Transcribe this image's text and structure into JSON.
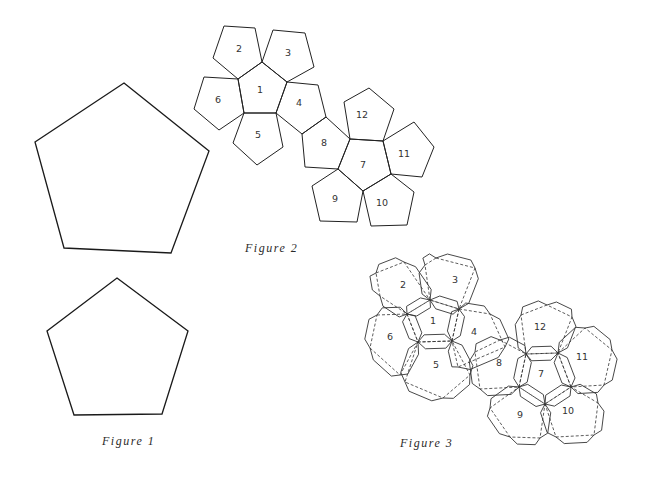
{
  "figures": {
    "figure1": {
      "caption": "Figure 1",
      "description": "Two regular pentagons (large and small) as templates",
      "large_pentagon": [
        [
          124,
          83
        ],
        [
          209,
          151
        ],
        [
          171,
          253
        ],
        [
          64,
          248
        ],
        [
          35,
          142
        ]
      ],
      "small_pentagon": [
        [
          117,
          278
        ],
        [
          188,
          331
        ],
        [
          162,
          414
        ],
        [
          74,
          415
        ],
        [
          47,
          331
        ]
      ]
    },
    "figure2": {
      "caption": "Figure 2",
      "description": "Dodecahedron net of 12 numbered pentagons",
      "faces": [
        {
          "label": "1",
          "pts": [
            [
              262,
              62
            ],
            [
              287,
              82
            ],
            [
              276,
              113
            ],
            [
              244,
              113
            ],
            [
              238,
              79
            ]
          ],
          "lx": 260,
          "ly": 93
        },
        {
          "label": "2",
          "pts": [
            [
              224,
              26
            ],
            [
              255,
              28
            ],
            [
              262,
              62
            ],
            [
              238,
              79
            ],
            [
              213,
              58
            ]
          ],
          "lx": 239,
          "ly": 52
        },
        {
          "label": "3",
          "pts": [
            [
              273,
              30
            ],
            [
              305,
              33
            ],
            [
              314,
              67
            ],
            [
              287,
              82
            ],
            [
              262,
              62
            ]
          ],
          "lx": 288,
          "ly": 56
        },
        {
          "label": "4",
          "pts": [
            [
              287,
              82
            ],
            [
              318,
              85
            ],
            [
              326,
              117
            ],
            [
              302,
              134
            ],
            [
              276,
              113
            ]
          ],
          "lx": 299,
          "ly": 106
        },
        {
          "label": "5",
          "pts": [
            [
              244,
              113
            ],
            [
              276,
              113
            ],
            [
              283,
              147
            ],
            [
              257,
              165
            ],
            [
              233,
              143
            ]
          ],
          "lx": 258,
          "ly": 138
        },
        {
          "label": "6",
          "pts": [
            [
              204,
              77
            ],
            [
              238,
              79
            ],
            [
              244,
              113
            ],
            [
              219,
              130
            ],
            [
              194,
              109
            ]
          ],
          "lx": 218,
          "ly": 103
        },
        {
          "label": "7",
          "pts": [
            [
              350,
              139
            ],
            [
              383,
              141
            ],
            [
              391,
              174
            ],
            [
              363,
              191
            ],
            [
              338,
              169
            ]
          ],
          "lx": 363,
          "ly": 168
        },
        {
          "label": "8",
          "pts": [
            [
              302,
              134
            ],
            [
              326,
              117
            ],
            [
              350,
              139
            ],
            [
              338,
              169
            ],
            [
              305,
              167
            ]
          ],
          "lx": 324,
          "ly": 146
        },
        {
          "label": "9",
          "pts": [
            [
              338,
              169
            ],
            [
              363,
              191
            ],
            [
              357,
              222
            ],
            [
              320,
              221
            ],
            [
              312,
              186
            ]
          ],
          "lx": 335,
          "ly": 202
        },
        {
          "label": "10",
          "pts": [
            [
              363,
              191
            ],
            [
              391,
              174
            ],
            [
              414,
              192
            ],
            [
              407,
              225
            ],
            [
              371,
              226
            ]
          ],
          "lx": 382,
          "ly": 206
        },
        {
          "label": "11",
          "pts": [
            [
              383,
              141
            ],
            [
              414,
              122
            ],
            [
              434,
              147
            ],
            [
              422,
              177
            ],
            [
              391,
              174
            ]
          ],
          "lx": 404,
          "ly": 157
        },
        {
          "label": "12",
          "pts": [
            [
              344,
              102
            ],
            [
              369,
              88
            ],
            [
              394,
              109
            ],
            [
              383,
              141
            ],
            [
              350,
              139
            ]
          ],
          "lx": 362,
          "ly": 118
        }
      ]
    },
    "figure3": {
      "caption": "Figure 3",
      "description": "Dodecahedron net with folding tabs and dashed fold lines",
      "faces": [
        {
          "label": "1",
          "pts": [
            [
              430,
              300
            ],
            [
              459,
              309
            ],
            [
              452,
              341
            ],
            [
              418,
              342
            ],
            [
              407,
              314
            ]
          ],
          "lx": 433,
          "ly": 324
        },
        {
          "label": "2",
          "pts": [
            [
              376,
              273
            ],
            [
              404,
              262
            ],
            [
              430,
              300
            ],
            [
              407,
              314
            ],
            [
              380,
              296
            ]
          ],
          "lx": 403,
          "ly": 288
        },
        {
          "label": "3",
          "pts": [
            [
              436,
              258
            ],
            [
              475,
              268
            ],
            [
              459,
              309
            ],
            [
              430,
              300
            ],
            [
              425,
              265
            ]
          ],
          "lx": 455,
          "ly": 283
        },
        {
          "label": "4",
          "pts": [
            [
              459,
              309
            ],
            [
              490,
              314
            ],
            [
              505,
              347
            ],
            [
              458,
              367
            ],
            [
              452,
              341
            ]
          ],
          "lx": 474,
          "ly": 335
        },
        {
          "label": "5",
          "pts": [
            [
              418,
              342
            ],
            [
              452,
              341
            ],
            [
              470,
              375
            ],
            [
              443,
              398
            ],
            [
              405,
              382
            ]
          ],
          "lx": 436,
          "ly": 368
        },
        {
          "label": "6",
          "pts": [
            [
              377,
              315
            ],
            [
              407,
              314
            ],
            [
              418,
              342
            ],
            [
              400,
              375
            ],
            [
              370,
              348
            ]
          ],
          "lx": 390,
          "ly": 340
        },
        {
          "label": "7",
          "pts": [
            [
              526,
              354
            ],
            [
              558,
              353
            ],
            [
              571,
              387
            ],
            [
              545,
              404
            ],
            [
              519,
              387
            ]
          ],
          "lx": 541,
          "ly": 377
        },
        {
          "label": "8",
          "pts": [
            [
              500,
              340
            ],
            [
              526,
              354
            ],
            [
              519,
              387
            ],
            [
              480,
              389
            ],
            [
              475,
              352
            ]
          ],
          "lx": 499,
          "ly": 366
        },
        {
          "label": "9",
          "pts": [
            [
              519,
              387
            ],
            [
              545,
              404
            ],
            [
              540,
              438
            ],
            [
              510,
              437
            ],
            [
              490,
              408
            ]
          ],
          "lx": 520,
          "ly": 418
        },
        {
          "label": "10",
          "pts": [
            [
              545,
              404
            ],
            [
              571,
              387
            ],
            [
              598,
              403
            ],
            [
              594,
              435
            ],
            [
              556,
              437
            ]
          ],
          "lx": 568,
          "ly": 414
        },
        {
          "label": "11",
          "pts": [
            [
              558,
              353
            ],
            [
              585,
              328
            ],
            [
              612,
              350
            ],
            [
              604,
              385
            ],
            [
              571,
              387
            ]
          ],
          "lx": 582,
          "ly": 360
        },
        {
          "label": "12",
          "pts": [
            [
              521,
              315
            ],
            [
              547,
              305
            ],
            [
              572,
              317
            ],
            [
              558,
              353
            ],
            [
              526,
              354
            ]
          ],
          "lx": 540,
          "ly": 330
        }
      ]
    }
  },
  "colors": {
    "background": "#ffffff",
    "line": "#222222",
    "caption": "#2a2a2a"
  }
}
